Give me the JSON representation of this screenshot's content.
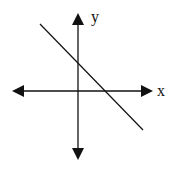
{
  "diagram": {
    "type": "coordinate-axes-with-line",
    "x_axis_label": "x",
    "y_axis_label": "y",
    "line": {
      "description": "line with negative slope, positive y-intercept and positive x-intercept"
    }
  }
}
